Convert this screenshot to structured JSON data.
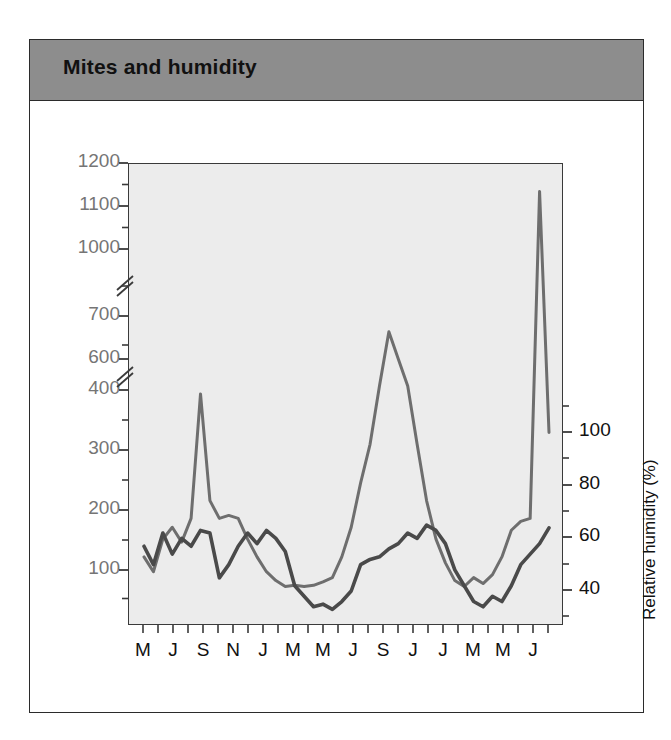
{
  "figure": {
    "title": "Mites and humidity",
    "title_bar_color": "#8d8d8d",
    "plot_background": "#ececec",
    "frame_color": "#2b2b2b"
  },
  "annotations": [
    {
      "name": "mite-density-label",
      "text": "Mite density",
      "x": 212,
      "y": 360
    },
    {
      "name": "rh-label",
      "text": "RH",
      "x": 355,
      "y": 555
    }
  ],
  "chart_data": {
    "type": "line",
    "title": "Mites and humidity",
    "xlabel": "",
    "ylabel": "Mites/gram dust",
    "y2label": "Relative humidity (%)",
    "grid": false,
    "legend": "inline-annotations",
    "axis_break": true,
    "axis_break_note": "Left axis has two breaks: between 400 and 600, and between 700 and 1000",
    "ylim": [
      0,
      1200
    ],
    "y2lim": [
      30,
      110
    ],
    "yticks_major": [
      100,
      200,
      300,
      400,
      600,
      700,
      1000,
      1100,
      1200
    ],
    "y2ticks_major": [
      40,
      60,
      80,
      100
    ],
    "y2ticks_minor": [
      50,
      70,
      90,
      110
    ],
    "x_tick_count": 28,
    "xticklabels": [
      "M",
      "J",
      "S",
      "N",
      "J",
      "M",
      "M",
      "J",
      "S",
      "J",
      "J",
      "M",
      "M",
      "J"
    ],
    "xticklabel_note": "Labels appear on every other tick; months March through June spanning about 4.5 years",
    "series": [
      {
        "name": "Mite density",
        "units": "mites/gram dust",
        "color": "#6e6e6e",
        "axis": "left",
        "values": [
          120,
          95,
          150,
          170,
          145,
          185,
          395,
          215,
          185,
          190,
          185,
          150,
          120,
          95,
          80,
          70,
          72,
          70,
          72,
          78,
          85,
          120,
          170,
          245,
          310,
          420,
          640,
          530,
          420,
          310,
          215,
          150,
          110,
          80,
          70,
          85,
          75,
          90,
          120,
          165,
          180,
          185,
          1110,
          330
        ]
      },
      {
        "name": "RH",
        "units": "relative humidity (%)",
        "color": "#4a4a4a",
        "axis": "right",
        "values": [
          57,
          50,
          62,
          54,
          60,
          57,
          63,
          62,
          45,
          50,
          57,
          62,
          58,
          63,
          60,
          55,
          42,
          38,
          34,
          35,
          33,
          36,
          40,
          50,
          52,
          53,
          56,
          58,
          62,
          60,
          65,
          63,
          58,
          48,
          42,
          36,
          34,
          38,
          36,
          42,
          50,
          54,
          58,
          64
        ]
      }
    ]
  },
  "axes": {
    "left_tick_labels": [
      {
        "value": "1200",
        "y": 163
      },
      {
        "value": "1100",
        "y": 206
      },
      {
        "value": "1000",
        "y": 249
      },
      {
        "value": "700",
        "y": 316
      },
      {
        "value": "600",
        "y": 359
      },
      {
        "value": "400",
        "y": 390
      },
      {
        "value": "300",
        "y": 450
      },
      {
        "value": "200",
        "y": 510
      },
      {
        "value": "100",
        "y": 570
      }
    ],
    "right_tick_labels": [
      {
        "value": "100",
        "y": 432
      },
      {
        "value": "80",
        "y": 485
      },
      {
        "value": "60",
        "y": 537
      },
      {
        "value": "40",
        "y": 590
      }
    ],
    "x_tick_labels": [
      "M",
      "J",
      "S",
      "N",
      "J",
      "M",
      "M",
      "J",
      "S",
      "J",
      "J",
      "M",
      "M",
      "J"
    ]
  }
}
